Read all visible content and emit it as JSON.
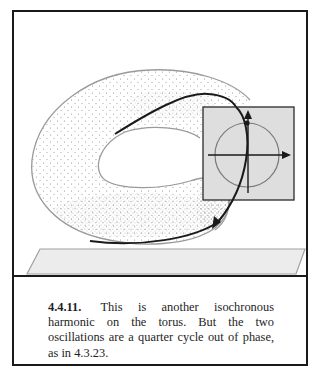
{
  "figure": {
    "number": "4.4.11.",
    "caption": "This is another isochronous harmonic on the torus. But the two oscillations are a quarter cycle out of phase, as in 4.3.23.",
    "inset": {
      "description": "phase portrait: circle with horizontal and vertical axes",
      "axes": [
        "horizontal-arrow",
        "vertical-arrow"
      ],
      "shape": "circle"
    },
    "colors": {
      "frame": "#1a1a1a",
      "torus_outline": "#9a9a9a",
      "stipple": "#8a8a8a",
      "trajectory": "#1a1a1a",
      "inset_fill": "#dedede",
      "base_plane_fill": "#ececec",
      "base_plane_outline": "#a0a0a0"
    }
  }
}
